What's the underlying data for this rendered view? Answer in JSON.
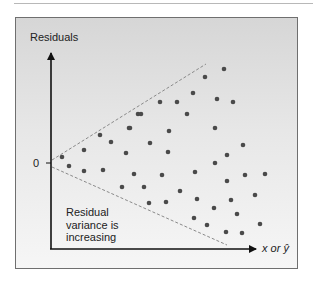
{
  "chart_data": {
    "type": "scatter",
    "title": "",
    "ylabel": "Residuals",
    "xlabel": "x or ŷ",
    "y_tick_labels": [
      "0"
    ],
    "annotation": "Residual variance is increasing",
    "annotation_lines": [
      "Residual",
      "variance is",
      "increasing"
    ],
    "envelope": "dashed funnel widening to the right",
    "points_px": [
      [
        62,
        157
      ],
      [
        69,
        166
      ],
      [
        84,
        150
      ],
      [
        84,
        171
      ],
      [
        100,
        135
      ],
      [
        103,
        170
      ],
      [
        111,
        142
      ],
      [
        122,
        187
      ],
      [
        126,
        153
      ],
      [
        129,
        128
      ],
      [
        130,
        128
      ],
      [
        134,
        174
      ],
      [
        138,
        114
      ],
      [
        141,
        114
      ],
      [
        144,
        187
      ],
      [
        149,
        203
      ],
      [
        150,
        143
      ],
      [
        160,
        102
      ],
      [
        162,
        175
      ],
      [
        166,
        202
      ],
      [
        168,
        152
      ],
      [
        169,
        131
      ],
      [
        177,
        102
      ],
      [
        180,
        191
      ],
      [
        187,
        114
      ],
      [
        193,
        93
      ],
      [
        194,
        218
      ],
      [
        195,
        172
      ],
      [
        197,
        199
      ],
      [
        205,
        77
      ],
      [
        207,
        225
      ],
      [
        214,
        208
      ],
      [
        215,
        128
      ],
      [
        215,
        163
      ],
      [
        217,
        99
      ],
      [
        224,
        69
      ],
      [
        226,
        232
      ],
      [
        227,
        155
      ],
      [
        227,
        181
      ],
      [
        231,
        200
      ],
      [
        233,
        102
      ],
      [
        237,
        214
      ],
      [
        242,
        233
      ],
      [
        243,
        145
      ],
      [
        245,
        175
      ],
      [
        255,
        195
      ],
      [
        260,
        224
      ],
      [
        265,
        174
      ]
    ],
    "colors": {
      "points": "#4a4a4a",
      "axes": "#111111",
      "envelope": "#8a8a8a",
      "background_top": "#d6d6d6",
      "background_bottom": "#f6f6f6"
    }
  },
  "labels": {
    "y_axis": "Residuals",
    "zero": "0",
    "x_axis": "x or ŷ",
    "note_line1": "Residual",
    "note_line2": "variance is",
    "note_line3": "increasing"
  }
}
